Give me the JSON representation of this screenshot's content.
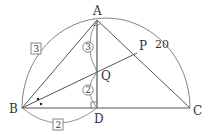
{
  "diagram": {
    "points": {
      "A": {
        "label": "A",
        "x": 97,
        "y": 20
      },
      "B": {
        "label": "B",
        "x": 22,
        "y": 108
      },
      "C": {
        "label": "C",
        "x": 190,
        "y": 108
      },
      "D": {
        "label": "D",
        "x": 97,
        "y": 108
      },
      "Q": {
        "label": "Q",
        "x": 97,
        "y": 72
      },
      "P": {
        "label": "P",
        "x": 137,
        "y": 53
      }
    },
    "labels": {
      "arc_AC": "20",
      "arc_AB": "3",
      "arc_BD": "2",
      "seg_AQ": "3",
      "seg_QD": "2"
    },
    "colors": {
      "line": "#555555",
      "arc": "#777777",
      "text": "#333333",
      "background": "#ffffff"
    }
  }
}
